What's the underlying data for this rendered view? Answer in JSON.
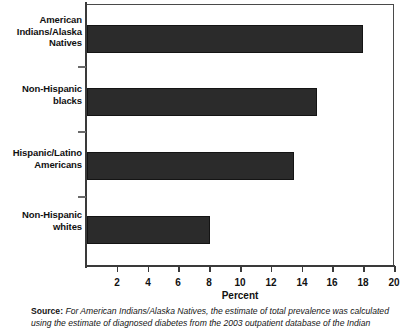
{
  "chart_data": {
    "type": "bar",
    "orientation": "horizontal",
    "title": "",
    "categories": [
      "American Indians/Alaska Natives",
      "Non-Hispanic blacks",
      "Hispanic/Latino Americans",
      "Non-Hispanic whites"
    ],
    "values": [
      18.0,
      15.0,
      13.5,
      8.0
    ],
    "xlabel": "Percent",
    "ylabel": "",
    "xlim": [
      0,
      20
    ],
    "xticks": [
      2,
      4,
      6,
      8,
      10,
      12,
      14,
      16,
      18,
      20
    ],
    "grid": false,
    "legend": false,
    "bar_color": "#2b2b2b",
    "axis_color": "#3a3a3a",
    "background": "#ffffff"
  },
  "category_labels": [
    {
      "line1": "American",
      "line2": "Indians/Alaska",
      "line3": "Natives"
    },
    {
      "line1": "Non-Hispanic",
      "line2": "blacks",
      "line3": ""
    },
    {
      "line1": "Hispanic/Latino",
      "line2": "Americans",
      "line3": ""
    },
    {
      "line1": "Non-Hispanic",
      "line2": "whites",
      "line3": ""
    }
  ],
  "axis": {
    "x_title": "Percent",
    "tick_labels": [
      "2",
      "4",
      "6",
      "8",
      "10",
      "12",
      "14",
      "16",
      "18",
      "20"
    ]
  },
  "source": {
    "label": "Source:",
    "text": "For American Indians/Alaska Natives, the estimate of total prevalence was calculated using the estimate of diagnosed diabetes from the 2003 outpatient database of the Indian"
  }
}
